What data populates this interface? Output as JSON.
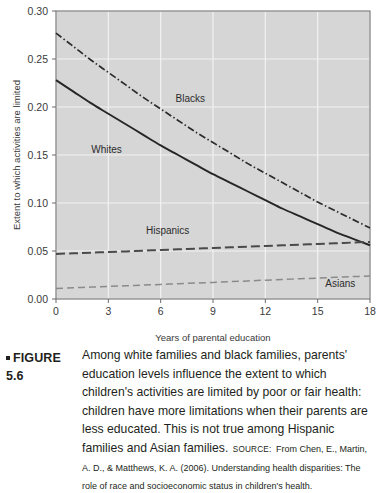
{
  "figure": {
    "bullet_icon": "square-bullet-icon",
    "label": "FIGURE 5.6",
    "caption": "Among white families and black families, parents' education levels influence the extent to which children's activities are limited by poor or fair health: children have more limitations when their parents are less educated. This is not true among Hispanic families and Asian families.",
    "source_keyword": "SOURCE:",
    "source_text": "From Chen, E., Martin, A. D., & Matthews, K. A. (2006). Understanding health disparities: The role of race and socioeconomic status in children's health."
  },
  "colors": {
    "plot_background": "#d6d6d6",
    "gridline": "#f2f2f2",
    "axis": "#6b6b6b",
    "whites_line": "#262626",
    "blacks_line": "#2b2b2b",
    "hispanics_line": "#4a4a4a",
    "asians_line": "#8a8a8a",
    "text": "#231f20"
  },
  "chart_data": {
    "type": "line",
    "title": "",
    "xlabel": "Years of parental education",
    "ylabel": "Extent to which activities are limited",
    "xlim": [
      0,
      18
    ],
    "ylim": [
      0.0,
      0.3
    ],
    "xticks": [
      0,
      3,
      6,
      9,
      12,
      15,
      18
    ],
    "xtick_labels": [
      "0",
      "3",
      "6",
      "9",
      "12",
      "15",
      "18"
    ],
    "yticks": [
      0.0,
      0.05,
      0.1,
      0.15,
      0.2,
      0.25,
      0.3
    ],
    "ytick_labels": [
      "0.00",
      "0.05",
      "0.10",
      "0.15",
      "0.20",
      "0.25",
      "0.30"
    ],
    "grid": true,
    "legend_position": "inline-labels",
    "x": [
      0,
      1,
      2,
      3,
      4,
      5,
      6,
      7,
      8,
      9,
      10,
      11,
      12,
      13,
      14,
      15,
      16,
      17,
      18
    ],
    "series": [
      {
        "name": "Blacks",
        "style": "dash-dot",
        "color": "#2b2b2b",
        "label_x": 7.7,
        "label_y": 0.205,
        "values": [
          0.277,
          0.263,
          0.249,
          0.236,
          0.223,
          0.21,
          0.198,
          0.186,
          0.174,
          0.163,
          0.152,
          0.141,
          0.131,
          0.121,
          0.111,
          0.101,
          0.092,
          0.083,
          0.074
        ]
      },
      {
        "name": "Whites",
        "style": "solid",
        "color": "#262626",
        "label_x": 2.9,
        "label_y": 0.152,
        "values": [
          0.228,
          0.216,
          0.204,
          0.193,
          0.182,
          0.171,
          0.16,
          0.15,
          0.14,
          0.13,
          0.121,
          0.112,
          0.103,
          0.094,
          0.086,
          0.078,
          0.07,
          0.063,
          0.056
        ]
      },
      {
        "name": "Hispanics",
        "style": "long-dash",
        "color": "#4a4a4a",
        "label_x": 6.4,
        "label_y": 0.068,
        "values": [
          0.047,
          0.0476,
          0.0483,
          0.0489,
          0.0496,
          0.0503,
          0.051,
          0.0517,
          0.0524,
          0.0531,
          0.0538,
          0.0545,
          0.0552,
          0.0559,
          0.0566,
          0.0573,
          0.058,
          0.0588,
          0.0595
        ]
      },
      {
        "name": "Asians",
        "style": "dash",
        "color": "#8a8a8a",
        "label_x": 16.3,
        "label_y": 0.013,
        "values": [
          0.011,
          0.0117,
          0.0124,
          0.0131,
          0.0138,
          0.0145,
          0.0152,
          0.0159,
          0.0166,
          0.0173,
          0.0181,
          0.0188,
          0.0196,
          0.0203,
          0.0211,
          0.0218,
          0.0226,
          0.0233,
          0.024
        ]
      }
    ]
  }
}
